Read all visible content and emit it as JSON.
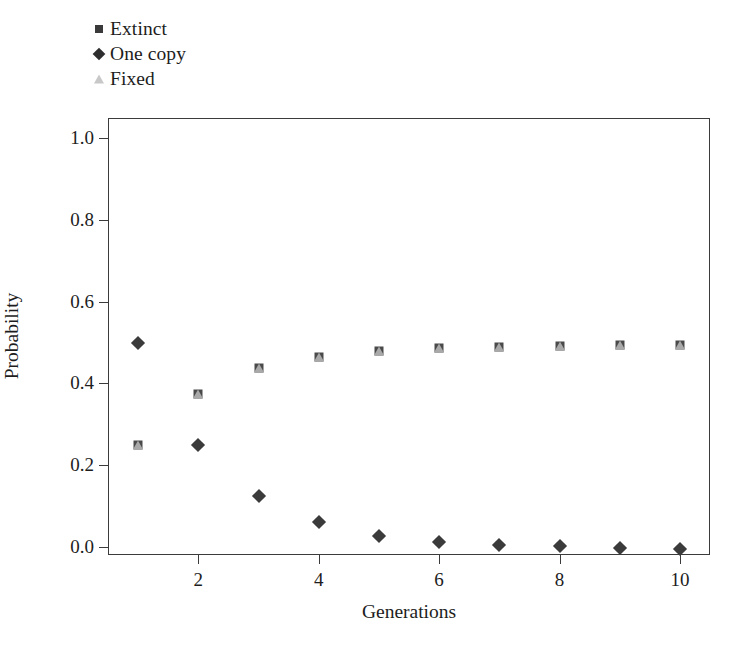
{
  "chart_data": {
    "type": "scatter",
    "title": "",
    "xlabel": "Generations",
    "ylabel": "Probability",
    "x": [
      1,
      2,
      3,
      4,
      5,
      6,
      7,
      8,
      9,
      10
    ],
    "xlim": [
      0.5,
      10.5
    ],
    "ylim": [
      -0.02,
      1.05
    ],
    "xticks": [
      2,
      4,
      6,
      8,
      10
    ],
    "xtick_labels": [
      "2",
      "4",
      "6",
      "8",
      "10"
    ],
    "yticks": [
      0.0,
      0.2,
      0.4,
      0.6,
      0.8,
      1.0
    ],
    "ytick_labels": [
      "0.0",
      "0.2",
      "0.4",
      "0.6",
      "0.8",
      "1.0"
    ],
    "grid": false,
    "legend_position": "top-left",
    "series": [
      {
        "name": "Extinct",
        "marker": "square",
        "color": "#4a4a4a",
        "values": [
          0.25,
          0.375,
          0.438,
          0.465,
          0.48,
          0.487,
          0.49,
          0.492,
          0.493,
          0.494
        ]
      },
      {
        "name": "One copy",
        "marker": "diamond",
        "color": "#3b3b3b",
        "values": [
          0.5,
          0.25,
          0.125,
          0.06,
          0.027,
          0.013,
          0.005,
          0.002,
          -0.002,
          -0.005
        ]
      },
      {
        "name": "Fixed",
        "marker": "triangle",
        "color": "#a9a9a9",
        "values": [
          0.25,
          0.375,
          0.438,
          0.465,
          0.48,
          0.487,
          0.49,
          0.492,
          0.493,
          0.494
        ]
      }
    ]
  },
  "legend": {
    "items": [
      {
        "label": "Extinct",
        "marker": "square-marker-icon"
      },
      {
        "label": "One copy",
        "marker": "diamond-marker-icon"
      },
      {
        "label": "Fixed",
        "marker": "triangle-marker-icon"
      }
    ]
  },
  "axes": {
    "x_title": "Generations",
    "y_title": "Probability"
  },
  "colors": {
    "axis": "#3b3b3b",
    "extinct": "#4a4a4a",
    "one_copy": "#3b3b3b",
    "fixed": "#a9a9a9",
    "background": "#ffffff"
  }
}
